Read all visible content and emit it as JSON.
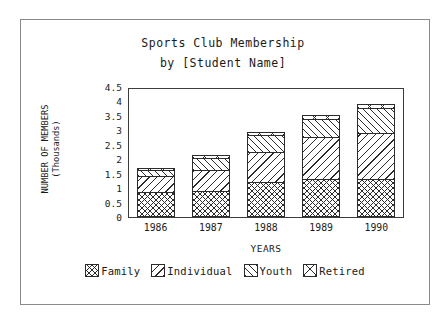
{
  "chart_data": {
    "type": "bar",
    "stacked": true,
    "title": "Sports Club Membership",
    "subtitle": "by [Student Name]",
    "xlabel": "YEARS",
    "ylabel": "NUMBER OF MEMBERS (Thousands)",
    "ylabel_line1": "NUMBER OF MEMBERS",
    "ylabel_line2": "(Thousands)",
    "categories": [
      "1986",
      "1987",
      "1988",
      "1989",
      "1990"
    ],
    "ylim": [
      0,
      4.5
    ],
    "yticks": [
      "0",
      "0.5",
      "1",
      "1.5",
      "2",
      "2.5",
      "3",
      "3.5",
      "4",
      "4.5"
    ],
    "ytick_values": [
      0,
      0.5,
      1,
      1.5,
      2,
      2.5,
      3,
      3.5,
      4,
      4.5
    ],
    "grid": false,
    "legend_position": "bottom",
    "series": [
      {
        "name": "Family",
        "pattern": "crosshatch-fine",
        "values": [
          0.85,
          0.9,
          1.2,
          1.3,
          1.33
        ]
      },
      {
        "name": "Individual",
        "pattern": "backslash-lines",
        "values": [
          0.6,
          0.75,
          1.1,
          1.5,
          1.62
        ]
      },
      {
        "name": "Youth",
        "pattern": "forwardslash-lines",
        "values": [
          0.25,
          0.45,
          0.6,
          0.65,
          0.9
        ]
      },
      {
        "name": "Retired",
        "pattern": "big-x",
        "values": [
          0.1,
          0.15,
          0.15,
          0.2,
          0.15
        ]
      }
    ],
    "totals": [
      1.8,
      2.25,
      3.05,
      3.65,
      4.0
    ]
  },
  "legend": {
    "items": [
      {
        "label": "Family"
      },
      {
        "label": "Individual"
      },
      {
        "label": "Youth"
      },
      {
        "label": "Retired"
      }
    ]
  }
}
